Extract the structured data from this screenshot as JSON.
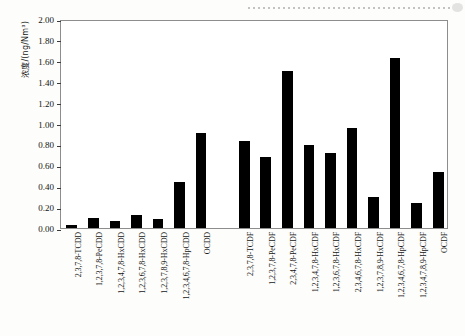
{
  "figure": {
    "background_color": "#fdfdfb",
    "bar_color": "#000000",
    "axis_color": "#8d8d8d",
    "artifact": "dotted-scan-line"
  },
  "chart_data": {
    "type": "bar",
    "title": "",
    "xlabel": "",
    "ylabel": "浓度/(ng/Nm³)",
    "ylim": [
      0,
      2.0
    ],
    "ytick_step": 0.2,
    "ytick_labels": [
      "0.00",
      "0.20",
      "0.40",
      "0.60",
      "0.80",
      "1.00",
      "1.20",
      "1.40",
      "1.60",
      "1.80",
      "2.00"
    ],
    "grid": false,
    "legend": false,
    "gap_after_index": 6,
    "categories": [
      "2,3,7,8-TCDD",
      "1,2,3,7,8-PeCDD",
      "1,2,3,4,7,8-HxCDD",
      "1,2,3,6,7,8-HxCDD",
      "1,2,3,7,8,9-HxCDD",
      "1,2,3,4,6,7,8-HpCDD",
      "OCDD",
      "2,3,7,8-TCDF",
      "1,2,3,7,8-PeCDF",
      "2,3,4,7,8-PeCDF",
      "1,2,3,4,7,8-HxCDF",
      "1,2,3,6,7,8-HxCDF",
      "2,3,4,6,7,8-HxCDF",
      "1,2,3,7,8,9-HxCDF",
      "1,2,3,4,6,7,8-HpCDF",
      "1,2,3,4,7,8,9-HpCDF",
      "OCDF"
    ],
    "values": [
      0.03,
      0.1,
      0.07,
      0.12,
      0.09,
      0.44,
      0.91,
      0.83,
      0.68,
      1.5,
      0.79,
      0.72,
      0.96,
      0.3,
      1.63,
      0.24,
      0.54
    ]
  }
}
